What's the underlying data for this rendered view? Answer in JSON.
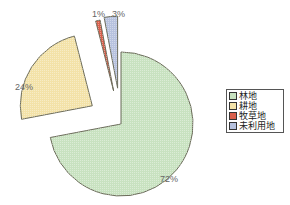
{
  "chart_data": {
    "type": "pie",
    "title": "",
    "categories": [
      "林地",
      "耕地",
      "牧草地",
      "未利用地"
    ],
    "values": [
      72,
      24,
      1,
      3
    ],
    "labels": [
      "72%",
      "24%",
      "1%",
      "3%"
    ],
    "colors": [
      "#c8e2c0",
      "#f3e2a8",
      "#d9604c",
      "#b7c2de"
    ],
    "exploded": true,
    "legend_position": "right"
  },
  "legend": {
    "items": [
      {
        "label": "林地",
        "color": "#c8e2c0"
      },
      {
        "label": "耕地",
        "color": "#f3e2a8"
      },
      {
        "label": "牧草地",
        "color": "#d9604c"
      },
      {
        "label": "未利用地",
        "color": "#b7c2de"
      }
    ]
  }
}
